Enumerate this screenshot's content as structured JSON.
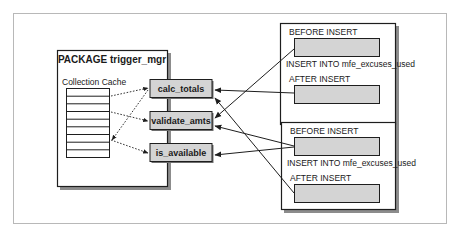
{
  "colors": {
    "frame": "#b8b8b8",
    "stroke": "#1e1e1e",
    "fill_gray": "#d4d4d4",
    "shadow": "#8c8c8c",
    "background": "#ffffff"
  },
  "package": {
    "title": "PACKAGE trigger_mgr",
    "cache_label": "Collection Cache",
    "cache_rows": 9,
    "procedures": [
      {
        "name": "calc_totals"
      },
      {
        "name": "validate_amts"
      },
      {
        "name": "is_available"
      }
    ]
  },
  "triggers": [
    {
      "before_label": "BEFORE INSERT",
      "statement_label": "INSERT INTO mfe_excuses_used",
      "after_label": "AFTER INSERT"
    },
    {
      "before_label": "BEFORE INSERT",
      "statement_label": "INSERT INTO mfe_excuses_used",
      "after_label": "AFTER INSERT"
    }
  ]
}
